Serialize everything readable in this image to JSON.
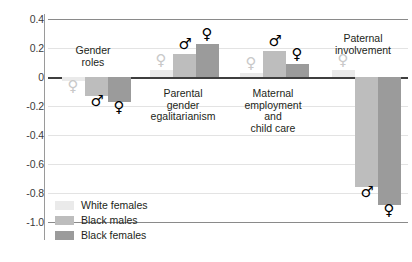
{
  "chart_data": {
    "type": "bar",
    "title": "",
    "subtitle": "",
    "xlabel": "",
    "ylabel": "",
    "ylim": [
      -1.0,
      0.4
    ],
    "grid": true,
    "orientation": "vertical",
    "legend_position": "bottom-left",
    "categories": [
      "Gender\nroles",
      "Parental\ngender\negalitarianism",
      "Maternal\nemployment\nand\nchild care",
      "Paternal\ninvolvement"
    ],
    "series": [
      {
        "name": "White females",
        "color": "#eaeaea",
        "marker": "female",
        "marker_style": "faded",
        "values": [
          -0.03,
          0.05,
          0.03,
          0.05
        ]
      },
      {
        "name": "Black males",
        "color": "#bdbdbd",
        "marker": "male",
        "marker_style": "solid",
        "values": [
          -0.13,
          0.16,
          0.18,
          -0.76
        ]
      },
      {
        "name": "Black females",
        "color": "#9b9b9b",
        "marker": "female",
        "marker_style": "solid",
        "values": [
          -0.17,
          0.23,
          0.09,
          -0.88
        ]
      }
    ],
    "yticks": [
      0.4,
      0.2,
      0,
      -0.2,
      -0.4,
      -0.6,
      -0.8,
      -1.0
    ],
    "ytick_labels": [
      "0.4",
      "0.2",
      "0",
      "-0.2",
      "-0.4",
      "-0.6",
      "-0.8",
      "-1.0"
    ],
    "zero_line": 0
  },
  "legend": {
    "items": [
      {
        "label": "White females",
        "swatch": "s0"
      },
      {
        "label": "Black males",
        "swatch": "s1"
      },
      {
        "label": "Black females",
        "swatch": "s2"
      }
    ]
  },
  "glyphs": {
    "female": "♀",
    "male": "♂"
  }
}
